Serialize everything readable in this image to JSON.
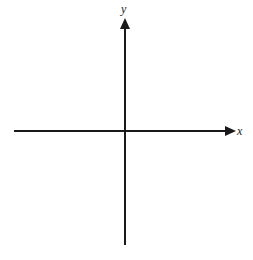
{
  "diagram": {
    "type": "coordinate-axes",
    "x_axis": {
      "label": "x",
      "direction": "right",
      "arrow": true
    },
    "y_axis": {
      "label": "y",
      "direction": "up",
      "arrow": true
    },
    "colors": {
      "axis": "#1a1a1a",
      "label": "#222222",
      "background": "#ffffff"
    }
  }
}
